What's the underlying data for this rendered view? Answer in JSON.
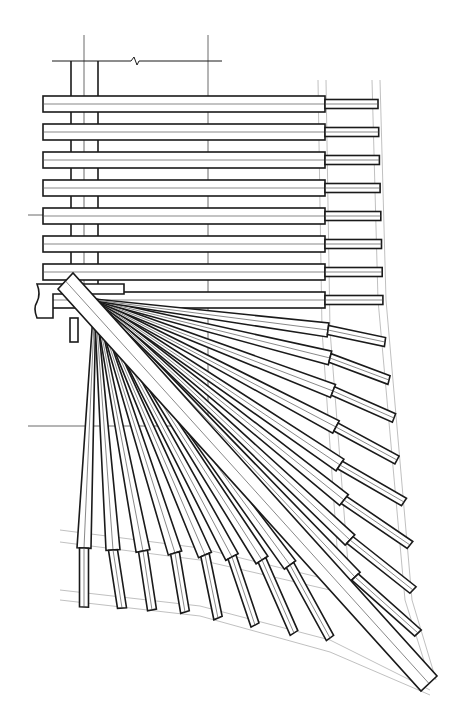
{
  "diagram": {
    "title": "",
    "type": "fan rafter hip-corner framing drawing (elevation/plan line art)",
    "colors": {
      "background": "#ffffff",
      "line": "#1a1a1a",
      "centerline": "#555555",
      "guide": "#b0b0b0"
    },
    "labels": [],
    "top_plate": {
      "y": 61,
      "x1": 52,
      "x2": 222,
      "break_x": 135
    },
    "post": {
      "x1": 71,
      "x2": 98,
      "center_x": 84,
      "y_top": 61,
      "y_bottom": 292
    },
    "vertical_guide_x": 208,
    "horizontal_rafters": {
      "x_start": 43,
      "x_wide_end": 325,
      "x_tail_end": 378,
      "height": 16,
      "tail_height": 9,
      "rows_y": [
        96,
        124,
        152,
        180,
        208,
        236,
        264,
        292
      ]
    },
    "wall_plate": {
      "x1": 33,
      "x2": 124,
      "y1": 284,
      "y2": 318
    },
    "hip_beam": {
      "corners": [
        [
          58,
          289
        ],
        [
          73,
          273
        ],
        [
          437,
          676
        ],
        [
          421,
          691
        ]
      ]
    },
    "fan_origin": [
      95,
      300
    ],
    "fan_rafters": [
      {
        "wide": [
          328,
          330
        ],
        "tail": [
          385,
          342
        ]
      },
      {
        "wide": [
          330,
          358
        ],
        "tail": [
          389,
          380
        ]
      },
      {
        "wide": [
          333,
          391
        ],
        "tail": [
          394,
          418
        ]
      },
      {
        "wide": [
          336,
          427
        ],
        "tail": [
          397,
          460
        ]
      },
      {
        "wide": [
          340,
          465
        ],
        "tail": [
          404,
          502
        ]
      },
      {
        "wide": [
          344,
          500
        ],
        "tail": [
          410,
          545
        ]
      },
      {
        "wide": [
          350,
          540
        ],
        "tail": [
          413,
          590
        ]
      },
      {
        "wide": [
          355,
          577
        ],
        "tail": [
          418,
          633
        ]
      },
      {
        "wide": [
          345,
          595
        ],
        "tail": [
          402,
          650
        ]
      },
      {
        "wide": [
          290,
          565
        ],
        "tail": [
          330,
          638
        ]
      },
      {
        "wide": [
          262,
          560
        ],
        "tail": [
          294,
          633
        ]
      },
      {
        "wide": [
          232,
          557
        ],
        "tail": [
          255,
          625
        ]
      },
      {
        "wide": [
          205,
          555
        ],
        "tail": [
          218,
          618
        ]
      },
      {
        "wide": [
          175,
          553
        ],
        "tail": [
          185,
          612
        ]
      },
      {
        "wide": [
          143,
          551
        ],
        "tail": [
          152,
          610
        ]
      },
      {
        "wide": [
          113,
          550
        ],
        "tail": [
          122,
          608
        ]
      },
      {
        "wide": [
          84,
          548
        ],
        "tail": [
          84,
          607
        ]
      }
    ],
    "guide_lines": [
      [
        [
          318,
          80
        ],
        [
          322,
          330
        ],
        [
          340,
          590
        ],
        [
          420,
          680
        ]
      ],
      [
        [
          326,
          80
        ],
        [
          330,
          330
        ],
        [
          350,
          590
        ],
        [
          430,
          680
        ]
      ],
      [
        [
          372,
          80
        ],
        [
          378,
          300
        ],
        [
          405,
          600
        ],
        [
          430,
          680
        ]
      ],
      [
        [
          380,
          80
        ],
        [
          386,
          300
        ],
        [
          412,
          600
        ],
        [
          436,
          680
        ]
      ],
      [
        [
          60,
          530
        ],
        [
          200,
          548
        ],
        [
          330,
          580
        ],
        [
          420,
          680
        ]
      ],
      [
        [
          60,
          542
        ],
        [
          200,
          560
        ],
        [
          330,
          590
        ],
        [
          420,
          685
        ]
      ],
      [
        [
          60,
          590
        ],
        [
          200,
          606
        ],
        [
          330,
          640
        ],
        [
          430,
          690
        ]
      ],
      [
        [
          60,
          600
        ],
        [
          200,
          616
        ],
        [
          330,
          652
        ],
        [
          430,
          695
        ]
      ]
    ],
    "crosshair_lines": [
      {
        "x1": 28,
        "y1": 215,
        "x2": 45,
        "y2": 215
      },
      {
        "x1": 28,
        "y1": 426,
        "x2": 207,
        "y2": 426
      }
    ]
  }
}
